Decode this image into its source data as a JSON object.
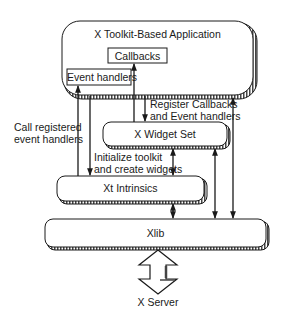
{
  "diagram": {
    "title": "X Toolkit-Based Application",
    "nodes": {
      "app": {
        "label": "X Toolkit-Based Application"
      },
      "callbacks": {
        "label": "Callbacks"
      },
      "event_handlers": {
        "label": "Event handlers"
      },
      "widget_set": {
        "label": "X Widget Set"
      },
      "xt_intrinsics": {
        "label": "Xt Intrinsics"
      },
      "xlib": {
        "label": "Xlib"
      },
      "x_server": {
        "label": "X Server"
      }
    },
    "edge_labels": {
      "call_registered": [
        "Call registered",
        "event handlers"
      ],
      "register_callbacks": [
        "Register Callbacks",
        "and Event handlers"
      ],
      "initialize_toolkit": [
        "Initialize toolkit",
        "and create widgets"
      ]
    },
    "edges": [
      {
        "from": "xt_intrinsics",
        "to": "event_handlers",
        "direction": "up"
      },
      {
        "from": "app",
        "to": "xt_intrinsics",
        "direction": "down"
      },
      {
        "from": "widget_set",
        "to": "callbacks",
        "direction": "up"
      },
      {
        "from": "app",
        "to": "widget_set",
        "direction": "down"
      },
      {
        "from": "widget_set",
        "to": "xt_intrinsics",
        "direction": "both"
      },
      {
        "from": "xt_intrinsics",
        "to": "xlib",
        "direction": "both"
      },
      {
        "from": "widget_set",
        "to": "xlib",
        "direction": "both"
      },
      {
        "from": "app",
        "to": "xlib",
        "direction": "both"
      },
      {
        "from": "xlib",
        "to": "x_server",
        "direction": "both"
      }
    ],
    "colors": {
      "stroke": "#1a1a1a",
      "fill": "#ffffff"
    }
  }
}
